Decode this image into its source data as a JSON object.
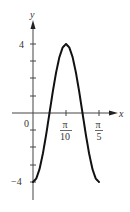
{
  "chart_data": {
    "type": "line",
    "title": "",
    "xlabel": "x",
    "ylabel": "y",
    "function": "y = -4cos(10x)",
    "xlim": [
      0,
      0.6283
    ],
    "ylim": [
      -4,
      4
    ],
    "x_ticks": [
      {
        "value": 0,
        "label": "0"
      },
      {
        "value": 0.31416,
        "label_num": "π",
        "label_den": "10"
      },
      {
        "value": 0.62832,
        "label_num": "π",
        "label_den": "5"
      }
    ],
    "y_ticks": [
      {
        "value": 4,
        "label": "4"
      },
      {
        "value": 3,
        "label": ""
      },
      {
        "value": 2,
        "label": ""
      },
      {
        "value": 1,
        "label": ""
      },
      {
        "value": -1,
        "label": ""
      },
      {
        "value": -2,
        "label": ""
      },
      {
        "value": -3,
        "label": ""
      },
      {
        "value": -4,
        "label": "−4"
      }
    ],
    "series": [
      {
        "name": "y = -4cos(10x)",
        "x": [
          0,
          0.0314,
          0.0628,
          0.0942,
          0.1257,
          0.1571,
          0.1885,
          0.2199,
          0.2513,
          0.2827,
          0.3142,
          0.3456,
          0.377,
          0.4084,
          0.4398,
          0.4712,
          0.5027,
          0.5341,
          0.5655,
          0.5969,
          0.6283
        ],
        "y": [
          -4,
          -3.8,
          -3.24,
          -2.35,
          -1.24,
          0,
          1.24,
          2.35,
          3.24,
          3.8,
          4,
          3.8,
          3.24,
          2.35,
          1.24,
          0,
          -1.24,
          -2.35,
          -3.24,
          -3.8,
          -4
        ]
      }
    ],
    "grid": false,
    "legend": "none",
    "color": "#111111"
  },
  "labels": {
    "x_axis": "x",
    "y_axis": "y",
    "origin": "0",
    "y_top": "4",
    "y_bottom": "−4",
    "pi": "π",
    "den_10": "10",
    "den_5": "5"
  }
}
